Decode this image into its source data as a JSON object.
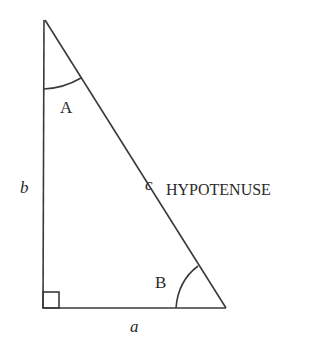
{
  "diagram": {
    "type": "right-triangle",
    "vertices": {
      "top": [
        45,
        20
      ],
      "bottom_left": [
        43,
        308
      ],
      "bottom_right": [
        226,
        308
      ]
    },
    "labels": {
      "angle_a": "A",
      "angle_b": "B",
      "side_a": "a",
      "side_b": "b",
      "side_c": "c",
      "hypotenuse": "HYPOTENUSE"
    },
    "colors": {
      "stroke": "#3a3a3a",
      "text": "#2a2a2a",
      "background": "#ffffff"
    }
  }
}
